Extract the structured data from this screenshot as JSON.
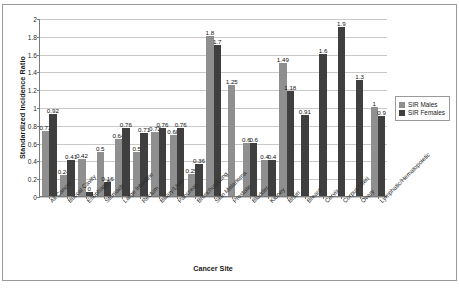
{
  "chart_data": {
    "type": "bar",
    "title": "",
    "xlabel": "Cancer Site",
    "ylabel": "Standardized Incidence Ratio",
    "ylim": [
      0,
      2
    ],
    "ytick_step": 0.2,
    "yticks": [
      "0",
      "0.2",
      "0.4",
      "0.6",
      "0.8",
      "1",
      "1.2",
      "1.4",
      "1.6",
      "1.8",
      "2"
    ],
    "grid": true,
    "legend_position": "right",
    "categories": [
      "All Cancer",
      "Buccal Cavity",
      "Esophagus",
      "Stomach",
      "Large Intestine",
      "Rectum",
      "Biliary/Liver",
      "Pancreas",
      "Bronchus/Lung",
      "Skin Melanoma",
      "Prostate",
      "Bladder",
      "Kidney",
      "Brain",
      "Breast",
      "Cervix",
      "Corpus Uteri",
      "Ovary",
      "Lymphatic/Hematopoietic"
    ],
    "series": [
      {
        "name": "SIR Males",
        "color": "#8f8f8f",
        "values": [
          0.73,
          0.24,
          0.42,
          0.5,
          0.64,
          0.5,
          0.72,
          0.68,
          0.25,
          1.8,
          1.25,
          0.6,
          0.4,
          1.49,
          null,
          null,
          null,
          null,
          1
        ],
        "labels": [
          "0.73",
          "0.24",
          "0.42",
          "0.5",
          "0.64",
          "0.5",
          "0.72",
          "0.68",
          "0.25",
          "1.8",
          "1.25",
          "0.6",
          "0.4",
          "1.49",
          "",
          "",
          "",
          "",
          "1"
        ]
      },
      {
        "name": "SIR Females",
        "color": "#3f3f3f",
        "values": [
          0.92,
          0.41,
          0.05,
          0.16,
          0.76,
          0.71,
          0.76,
          0.76,
          0.36,
          1.7,
          null,
          0.6,
          0.4,
          1.18,
          0.91,
          1.6,
          1.9,
          1.3,
          0.9
        ],
        "labels": [
          "0.92",
          "0.41",
          "0",
          "0.16",
          "0.76",
          "0.71",
          "0.76",
          "0.76",
          "0.36",
          "1.7",
          "",
          "0.6",
          "0.4",
          "1.18",
          "0.91",
          "1.6",
          "1.9",
          "1.3",
          "0.9"
        ]
      }
    ]
  },
  "legend": {
    "items": [
      {
        "label": "SIR Males"
      },
      {
        "label": "SIR Females"
      }
    ]
  }
}
